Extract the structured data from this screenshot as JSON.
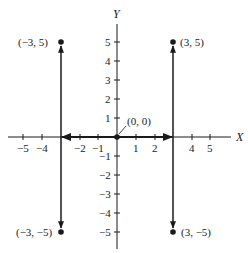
{
  "figure": {
    "type": "coordinate-plane",
    "axes": {
      "x_label": "X",
      "y_label": "Y",
      "x_ticks": [
        {
          "value": -5,
          "label": "−5"
        },
        {
          "value": -4,
          "label": "−4"
        },
        {
          "value": -2,
          "label": "−2"
        },
        {
          "value": -1,
          "label": "−1"
        },
        {
          "value": 1,
          "label": "1"
        },
        {
          "value": 2,
          "label": "2"
        },
        {
          "value": 4,
          "label": "4"
        },
        {
          "value": 5,
          "label": "5"
        }
      ],
      "y_ticks": [
        {
          "value": 5,
          "label": "5"
        },
        {
          "value": 4,
          "label": "4"
        },
        {
          "value": 3,
          "label": "3"
        },
        {
          "value": 2,
          "label": "2"
        },
        {
          "value": 1,
          "label": "1"
        },
        {
          "value": -1,
          "label": "−1"
        },
        {
          "value": -2,
          "label": "−2"
        },
        {
          "value": -3,
          "label": "−3"
        },
        {
          "value": -4,
          "label": "−4"
        },
        {
          "value": -5,
          "label": "−5"
        }
      ]
    },
    "points": [
      {
        "id": "p-neg3-5",
        "x": -3,
        "y": 5,
        "label": "(−3, 5)"
      },
      {
        "id": "p-3-5",
        "x": 3,
        "y": 5,
        "label": "(3, 5)"
      },
      {
        "id": "p-origin",
        "x": 0,
        "y": 0,
        "label": "(0, 0)"
      },
      {
        "id": "p-neg3-neg5",
        "x": -3,
        "y": -5,
        "label": "(−3, −5)"
      },
      {
        "id": "p-3-neg5",
        "x": 3,
        "y": -5,
        "label": "(3, −5)"
      }
    ],
    "arrows": [
      {
        "from": [
          0,
          0
        ],
        "to": [
          -3,
          0
        ],
        "style": "bold"
      },
      {
        "from": [
          0,
          0
        ],
        "to": [
          3,
          0
        ],
        "style": "bold"
      },
      {
        "from": [
          -3,
          0
        ],
        "to": [
          -3,
          5
        ]
      },
      {
        "from": [
          -3,
          0
        ],
        "to": [
          -3,
          -5
        ]
      },
      {
        "from": [
          3,
          0
        ],
        "to": [
          3,
          5
        ]
      },
      {
        "from": [
          3,
          0
        ],
        "to": [
          3,
          -5
        ]
      }
    ],
    "colors": {
      "ink": "#1a1a1a",
      "background": "#ffffff"
    }
  }
}
